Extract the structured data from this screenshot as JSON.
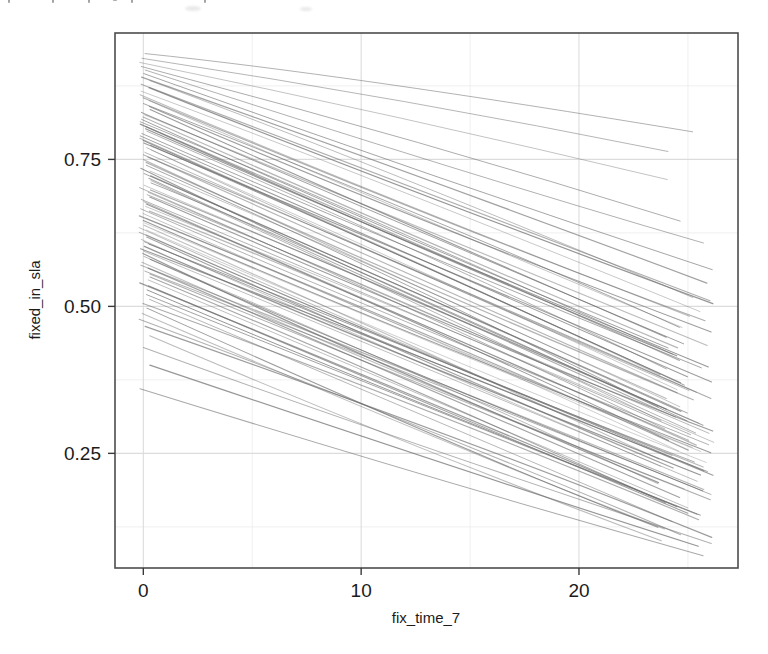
{
  "figure": {
    "background_color": "#ffffff",
    "panel_color": "#ffffff",
    "panel_border_color": "#4d4d4d",
    "grid_color": "#e6e6e6",
    "line_color": "#6b6b6b",
    "axis_text_color": "#1b1b1b"
  },
  "chart_data": {
    "type": "line",
    "title": "",
    "subtitle": "",
    "xlabel": "fix_time_7",
    "ylabel": "fixed_in_sla",
    "xlim": [
      -1.3,
      27.3
    ],
    "ylim": [
      0.055,
      0.965
    ],
    "xticks": [
      0,
      10,
      20
    ],
    "xtick_labels": [
      "0",
      "10",
      "20"
    ],
    "yticks": [
      0.25,
      0.5,
      0.75
    ],
    "ytick_labels": [
      "0.25",
      "0.50",
      "0.75"
    ],
    "grid": true,
    "grid_major_x": [
      0,
      10,
      20
    ],
    "grid_major_y": [
      0.25,
      0.5,
      0.75
    ],
    "grid_minor_x": [
      5,
      15,
      25
    ],
    "grid_minor_y": [
      0.125,
      0.375,
      0.625,
      0.875
    ],
    "legend": "none",
    "legend_position": "none",
    "annotations": [],
    "n_series": 100,
    "x_common": [
      0,
      26.2
    ],
    "series": [
      {
        "name": "t1",
        "x": [
          0,
          26.2
        ],
        "values": [
          0.93,
          0.8
        ]
      },
      {
        "name": "t2",
        "x": [
          0,
          26.2
        ],
        "values": [
          0.922,
          0.76
        ]
      },
      {
        "name": "t3",
        "x": [
          0,
          26.2
        ],
        "values": [
          0.915,
          0.72
        ]
      },
      {
        "name": "t4",
        "x": [
          0,
          26.2
        ],
        "values": [
          0.908,
          0.64
        ]
      },
      {
        "name": "t5",
        "x": [
          0,
          26.2
        ],
        "values": [
          0.902,
          0.61
        ]
      },
      {
        "name": "t6",
        "x": [
          0,
          26.2
        ],
        "values": [
          0.896,
          0.56
        ]
      },
      {
        "name": "t7",
        "x": [
          0,
          26.2
        ],
        "values": [
          0.89,
          0.545
        ]
      },
      {
        "name": "t8",
        "x": [
          0,
          26.2
        ],
        "values": [
          0.884,
          0.52
        ]
      },
      {
        "name": "t9",
        "x": [
          0,
          26.2
        ],
        "values": [
          0.878,
          0.505
        ]
      },
      {
        "name": "t10",
        "x": [
          0,
          26.2
        ],
        "values": [
          0.872,
          0.5
        ]
      },
      {
        "name": "t11",
        "x": [
          0,
          26.2
        ],
        "values": [
          0.866,
          0.492
        ]
      },
      {
        "name": "t12",
        "x": [
          0,
          26.2
        ],
        "values": [
          0.86,
          0.486
        ]
      },
      {
        "name": "t13",
        "x": [
          0,
          26.2
        ],
        "values": [
          0.855,
          0.478
        ]
      },
      {
        "name": "t14",
        "x": [
          0,
          26.2
        ],
        "values": [
          0.85,
          0.47
        ]
      },
      {
        "name": "t15",
        "x": [
          0,
          26.2
        ],
        "values": [
          0.845,
          0.462
        ]
      },
      {
        "name": "t16",
        "x": [
          0,
          26.2
        ],
        "values": [
          0.84,
          0.455
        ]
      },
      {
        "name": "t17",
        "x": [
          0,
          26.2
        ],
        "values": [
          0.835,
          0.448
        ]
      },
      {
        "name": "t18",
        "x": [
          0,
          26.2
        ],
        "values": [
          0.83,
          0.442
        ]
      },
      {
        "name": "t19",
        "x": [
          0,
          26.2
        ],
        "values": [
          0.826,
          0.436
        ]
      },
      {
        "name": "t20",
        "x": [
          0,
          26.2
        ],
        "values": [
          0.822,
          0.43
        ]
      },
      {
        "name": "t21",
        "x": [
          0,
          26.2
        ],
        "values": [
          0.818,
          0.424
        ]
      },
      {
        "name": "t22",
        "x": [
          0,
          26.2
        ],
        "values": [
          0.814,
          0.418
        ]
      },
      {
        "name": "t23",
        "x": [
          0,
          26.2
        ],
        "values": [
          0.81,
          0.412
        ]
      },
      {
        "name": "t24",
        "x": [
          0,
          26.2
        ],
        "values": [
          0.806,
          0.406
        ]
      },
      {
        "name": "t25",
        "x": [
          0,
          26.2
        ],
        "values": [
          0.802,
          0.4
        ]
      },
      {
        "name": "t26",
        "x": [
          0,
          26.2
        ],
        "values": [
          0.798,
          0.395
        ]
      },
      {
        "name": "t27",
        "x": [
          0,
          26.2
        ],
        "values": [
          0.794,
          0.39
        ]
      },
      {
        "name": "t28",
        "x": [
          0,
          26.2
        ],
        "values": [
          0.79,
          0.385
        ]
      },
      {
        "name": "t29",
        "x": [
          0,
          26.2
        ],
        "values": [
          0.786,
          0.38
        ]
      },
      {
        "name": "t30",
        "x": [
          0,
          26.2
        ],
        "values": [
          0.782,
          0.375
        ]
      },
      {
        "name": "t31",
        "x": [
          0,
          26.2
        ],
        "values": [
          0.778,
          0.37
        ]
      },
      {
        "name": "t32",
        "x": [
          0,
          26.2
        ],
        "values": [
          0.774,
          0.365
        ]
      },
      {
        "name": "t33",
        "x": [
          0,
          26.2
        ],
        "values": [
          0.77,
          0.36
        ]
      },
      {
        "name": "t34",
        "x": [
          0,
          26.2
        ],
        "values": [
          0.766,
          0.356
        ]
      },
      {
        "name": "t35",
        "x": [
          0,
          26.2
        ],
        "values": [
          0.762,
          0.352
        ]
      },
      {
        "name": "t36",
        "x": [
          0,
          26.2
        ],
        "values": [
          0.758,
          0.348
        ]
      },
      {
        "name": "t37",
        "x": [
          0,
          26.2
        ],
        "values": [
          0.754,
          0.344
        ]
      },
      {
        "name": "t38",
        "x": [
          0,
          26.2
        ],
        "values": [
          0.75,
          0.34
        ]
      },
      {
        "name": "t39",
        "x": [
          0,
          26.2
        ],
        "values": [
          0.745,
          0.336
        ]
      },
      {
        "name": "t40",
        "x": [
          0,
          26.2
        ],
        "values": [
          0.74,
          0.332
        ]
      },
      {
        "name": "t41",
        "x": [
          0,
          26.2
        ],
        "values": [
          0.735,
          0.328
        ]
      },
      {
        "name": "t42",
        "x": [
          0,
          26.2
        ],
        "values": [
          0.73,
          0.324
        ]
      },
      {
        "name": "t43",
        "x": [
          0,
          26.2
        ],
        "values": [
          0.726,
          0.32
        ]
      },
      {
        "name": "t44",
        "x": [
          0,
          26.2
        ],
        "values": [
          0.722,
          0.316
        ]
      },
      {
        "name": "t45",
        "x": [
          0,
          26.2
        ],
        "values": [
          0.718,
          0.312
        ]
      },
      {
        "name": "t46",
        "x": [
          0,
          26.2
        ],
        "values": [
          0.714,
          0.308
        ]
      },
      {
        "name": "t47",
        "x": [
          0,
          26.2
        ],
        "values": [
          0.71,
          0.304
        ]
      },
      {
        "name": "t48",
        "x": [
          0,
          26.2
        ],
        "values": [
          0.706,
          0.3
        ]
      },
      {
        "name": "t49",
        "x": [
          0,
          26.2
        ],
        "values": [
          0.702,
          0.296
        ]
      },
      {
        "name": "t50",
        "x": [
          0,
          26.2
        ],
        "values": [
          0.698,
          0.292
        ]
      },
      {
        "name": "t51",
        "x": [
          0,
          26.2
        ],
        "values": [
          0.694,
          0.288
        ]
      },
      {
        "name": "t52",
        "x": [
          0,
          26.2
        ],
        "values": [
          0.69,
          0.285
        ]
      },
      {
        "name": "t53",
        "x": [
          0,
          26.2
        ],
        "values": [
          0.686,
          0.282
        ]
      },
      {
        "name": "t54",
        "x": [
          0,
          26.2
        ],
        "values": [
          0.682,
          0.279
        ]
      },
      {
        "name": "t55",
        "x": [
          0,
          26.2
        ],
        "values": [
          0.678,
          0.276
        ]
      },
      {
        "name": "t56",
        "x": [
          0,
          26.2
        ],
        "values": [
          0.674,
          0.273
        ]
      },
      {
        "name": "t57",
        "x": [
          0,
          26.2
        ],
        "values": [
          0.67,
          0.27
        ]
      },
      {
        "name": "t58",
        "x": [
          0,
          26.2
        ],
        "values": [
          0.666,
          0.267
        ]
      },
      {
        "name": "t59",
        "x": [
          0,
          26.2
        ],
        "values": [
          0.662,
          0.264
        ]
      },
      {
        "name": "t60",
        "x": [
          0,
          26.2
        ],
        "values": [
          0.658,
          0.261
        ]
      },
      {
        "name": "t61",
        "x": [
          0,
          26.2
        ],
        "values": [
          0.654,
          0.258
        ]
      },
      {
        "name": "t62",
        "x": [
          0,
          26.2
        ],
        "values": [
          0.65,
          0.255
        ]
      },
      {
        "name": "t63",
        "x": [
          0,
          26.2
        ],
        "values": [
          0.646,
          0.252
        ]
      },
      {
        "name": "t64",
        "x": [
          0,
          26.2
        ],
        "values": [
          0.642,
          0.249
        ]
      },
      {
        "name": "t65",
        "x": [
          0,
          26.2
        ],
        "values": [
          0.638,
          0.246
        ]
      },
      {
        "name": "t66",
        "x": [
          0,
          26.2
        ],
        "values": [
          0.634,
          0.243
        ]
      },
      {
        "name": "t67",
        "x": [
          0,
          26.2
        ],
        "values": [
          0.63,
          0.24
        ]
      },
      {
        "name": "t68",
        "x": [
          0,
          26.2
        ],
        "values": [
          0.626,
          0.236
        ]
      },
      {
        "name": "t69",
        "x": [
          0,
          26.2
        ],
        "values": [
          0.622,
          0.232
        ]
      },
      {
        "name": "t70",
        "x": [
          0,
          26.2
        ],
        "values": [
          0.618,
          0.228
        ]
      },
      {
        "name": "t71",
        "x": [
          0,
          26.2
        ],
        "values": [
          0.614,
          0.224
        ]
      },
      {
        "name": "t72",
        "x": [
          0,
          26.2
        ],
        "values": [
          0.61,
          0.22
        ]
      },
      {
        "name": "t73",
        "x": [
          0,
          26.2
        ],
        "values": [
          0.606,
          0.216
        ]
      },
      {
        "name": "t74",
        "x": [
          0,
          26.2
        ],
        "values": [
          0.602,
          0.212
        ]
      },
      {
        "name": "t75",
        "x": [
          0,
          26.2
        ],
        "values": [
          0.598,
          0.208
        ]
      },
      {
        "name": "t76",
        "x": [
          0,
          26.2
        ],
        "values": [
          0.594,
          0.204
        ]
      },
      {
        "name": "t77",
        "x": [
          0,
          26.2
        ],
        "values": [
          0.59,
          0.2
        ]
      },
      {
        "name": "t78",
        "x": [
          0,
          26.2
        ],
        "values": [
          0.585,
          0.196
        ]
      },
      {
        "name": "t79",
        "x": [
          0,
          26.2
        ],
        "values": [
          0.58,
          0.192
        ]
      },
      {
        "name": "t80",
        "x": [
          0,
          26.2
        ],
        "values": [
          0.575,
          0.188
        ]
      },
      {
        "name": "t81",
        "x": [
          0,
          26.2
        ],
        "values": [
          0.57,
          0.184
        ]
      },
      {
        "name": "t82",
        "x": [
          0,
          26.2
        ],
        "values": [
          0.565,
          0.18
        ]
      },
      {
        "name": "t83",
        "x": [
          0,
          26.2
        ],
        "values": [
          0.56,
          0.176
        ]
      },
      {
        "name": "t84",
        "x": [
          0,
          26.2
        ],
        "values": [
          0.555,
          0.172
        ]
      },
      {
        "name": "t85",
        "x": [
          0,
          26.2
        ],
        "values": [
          0.55,
          0.168
        ]
      },
      {
        "name": "t86",
        "x": [
          0,
          26.2
        ],
        "values": [
          0.545,
          0.163
        ]
      },
      {
        "name": "t87",
        "x": [
          0,
          26.2
        ],
        "values": [
          0.54,
          0.158
        ]
      },
      {
        "name": "t88",
        "x": [
          0,
          26.2
        ],
        "values": [
          0.535,
          0.153
        ]
      },
      {
        "name": "t89",
        "x": [
          0,
          26.2
        ],
        "values": [
          0.528,
          0.148
        ]
      },
      {
        "name": "t90",
        "x": [
          0,
          26.2
        ],
        "values": [
          0.52,
          0.143
        ]
      },
      {
        "name": "t91",
        "x": [
          0,
          26.2
        ],
        "values": [
          0.512,
          0.138
        ]
      },
      {
        "name": "t92",
        "x": [
          0,
          26.2
        ],
        "values": [
          0.505,
          0.133
        ]
      },
      {
        "name": "t93",
        "x": [
          0,
          26.2
        ],
        "values": [
          0.497,
          0.127
        ]
      },
      {
        "name": "t94",
        "x": [
          0,
          26.2
        ],
        "values": [
          0.488,
          0.121
        ]
      },
      {
        "name": "t95",
        "x": [
          0,
          26.2
        ],
        "values": [
          0.478,
          0.115
        ]
      },
      {
        "name": "t96",
        "x": [
          0,
          26.2
        ],
        "values": [
          0.466,
          0.11
        ]
      },
      {
        "name": "t97",
        "x": [
          0,
          26.2
        ],
        "values": [
          0.45,
          0.104
        ]
      },
      {
        "name": "t98",
        "x": [
          0,
          26.2
        ],
        "values": [
          0.43,
          0.098
        ]
      },
      {
        "name": "t99",
        "x": [
          0,
          26.2
        ],
        "values": [
          0.4,
          0.09
        ]
      },
      {
        "name": "t100",
        "x": [
          0,
          26.2
        ],
        "values": [
          0.36,
          0.08
        ]
      }
    ]
  }
}
